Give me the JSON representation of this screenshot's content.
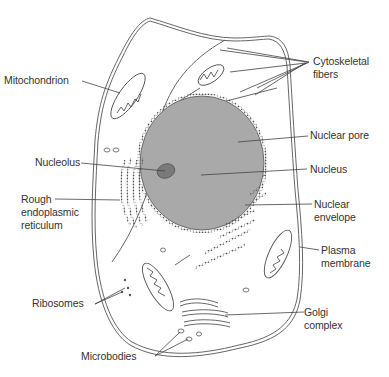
{
  "diagram": {
    "colors": {
      "line": "#555555",
      "nucleus": "#a9a9a9",
      "nucleolus": "#7a7a7a",
      "background": "#ffffff"
    },
    "labels": {
      "mitochondrion": "Mitochondrion",
      "cytoskeletal_fibers": "Cytoskeletal\nfibers",
      "nuclear_pore": "Nuclear pore",
      "nucleolus": "Nucleolus",
      "nucleus": "Nucleus",
      "rough_er": "Rough\nendoplasmic\nreticulum",
      "nuclear_envelope": "Nuclear\nenvelope",
      "plasma_membrane": "Plasma\nmembrane",
      "ribosomes": "Ribosomes",
      "golgi_complex": "Golgi\ncomplex",
      "microbodies": "Microbodies"
    }
  }
}
